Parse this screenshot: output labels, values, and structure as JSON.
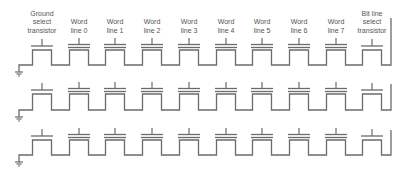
{
  "diagram": {
    "type": "NAND flash string schematic",
    "line_color": "#6b6b6b",
    "text_color": "#555555",
    "columns": [
      {
        "label": "Ground\nselect\ntransistor",
        "kind": "select",
        "x": 42
      },
      {
        "label": "Word\nline 0",
        "kind": "cell",
        "x": 79
      },
      {
        "label": "Word\nline 1",
        "kind": "cell",
        "x": 115
      },
      {
        "label": "Word\nline 2",
        "kind": "cell",
        "x": 152
      },
      {
        "label": "Word\nline 3",
        "kind": "cell",
        "x": 189
      },
      {
        "label": "Word\nline 4",
        "kind": "cell",
        "x": 226
      },
      {
        "label": "Word\nline 5",
        "kind": "cell",
        "x": 262
      },
      {
        "label": "Word\nline 6",
        "kind": "cell",
        "x": 299
      },
      {
        "label": "Word\nline 7",
        "kind": "cell",
        "x": 336
      },
      {
        "label": "Bit line\nselect\ntransistor",
        "kind": "select",
        "x": 372
      }
    ],
    "rows": [
      {
        "gate_y": 46,
        "top_y": 50,
        "bottom_y": 65,
        "ground_y": 72,
        "bitline_top": 18
      },
      {
        "gate_y": 90,
        "top_y": 94,
        "bottom_y": 110,
        "ground_y": 117,
        "bitline_top": 84
      },
      {
        "gate_y": 136,
        "top_y": 140,
        "bottom_y": 155,
        "ground_y": 162,
        "bitline_top": 130
      }
    ],
    "bitline_x": 391
  }
}
